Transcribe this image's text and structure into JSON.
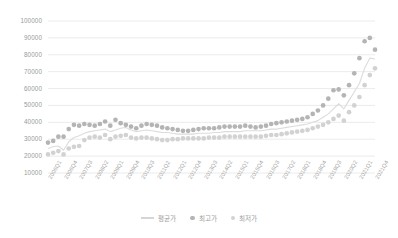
{
  "chart_data": {
    "type": "scatter",
    "title": "",
    "xlabel": "",
    "ylabel": "",
    "ylim": [
      10000,
      100000
    ],
    "ytick_values": [
      10000,
      20000,
      30000,
      40000,
      50000,
      60000,
      70000,
      80000,
      90000,
      100000
    ],
    "ytick_labels": [
      "10000",
      "20000",
      "30000",
      "40000",
      "50000",
      "60000",
      "70000",
      "80000",
      "90000",
      "100000"
    ],
    "grid": true,
    "grid_axis": "y",
    "legend_position": "bottom",
    "x": [
      "2006Q1",
      "2006Q2",
      "2006Q3",
      "2006Q4",
      "2007Q1",
      "2007Q2",
      "2007Q3",
      "2007Q4",
      "2008Q1",
      "2008Q2",
      "2008Q3",
      "2008Q4",
      "2009Q1",
      "2009Q2",
      "2009Q3",
      "2009Q4",
      "2010Q1",
      "2010Q2",
      "2010Q3",
      "2010Q4",
      "2011Q1",
      "2011Q2",
      "2011Q3",
      "2011Q4",
      "2012Q1",
      "2012Q2",
      "2012Q3",
      "2012Q4",
      "2013Q1",
      "2013Q2",
      "2013Q3",
      "2013Q4",
      "2014Q1",
      "2014Q2",
      "2014Q3",
      "2014Q4",
      "2015Q1",
      "2015Q2",
      "2015Q3",
      "2015Q4",
      "2016Q1",
      "2016Q2",
      "2016Q3",
      "2016Q4",
      "2017Q1",
      "2017Q2",
      "2017Q3",
      "2017Q4",
      "2018Q1",
      "2018Q2",
      "2018Q3",
      "2018Q4",
      "2019Q1",
      "2019Q2",
      "2019Q3",
      "2019Q4",
      "2020Q1",
      "2020Q2",
      "2020Q3",
      "2020Q4",
      "2021Q1",
      "2021Q2",
      "2021Q3",
      "2021Q4"
    ],
    "xtick_labels": [
      "2006Q1",
      "2006Q4",
      "2007Q3",
      "2008Q2",
      "2009Q1",
      "2009Q4",
      "2010Q3",
      "2011Q2",
      "2012Q1",
      "2012Q4",
      "2013Q3",
      "2014Q2",
      "2015Q1",
      "2015Q4",
      "2016Q3",
      "2017Q2",
      "2018Q1",
      "2018Q4",
      "2019Q3",
      "2020Q2",
      "2021Q1",
      "2021Q4"
    ],
    "xtick_step": 3,
    "series": [
      {
        "name": "평균가",
        "kind": "line",
        "color": "#dcdcdc",
        "values": [
          24500,
          25500,
          26000,
          23500,
          28500,
          31000,
          32000,
          33500,
          34500,
          35000,
          35500,
          36000,
          34500,
          35500,
          36500,
          37000,
          35500,
          34500,
          35000,
          35500,
          35000,
          34500,
          34000,
          34000,
          33500,
          33000,
          33000,
          33000,
          33000,
          33500,
          33500,
          33500,
          34000,
          34000,
          34500,
          34500,
          34500,
          34500,
          35000,
          35000,
          35000,
          35000,
          35500,
          36000,
          36000,
          36500,
          37000,
          37500,
          38000,
          38500,
          39000,
          40000,
          41000,
          43000,
          45000,
          48000,
          51000,
          48000,
          53000,
          58000,
          63000,
          72000,
          78000,
          77500
        ]
      },
      {
        "name": "최고가",
        "kind": "scatter",
        "color": "#b4b4b4",
        "values": [
          28000,
          29000,
          31500,
          31500,
          36000,
          38500,
          38000,
          39000,
          38500,
          38000,
          39000,
          40500,
          38000,
          41500,
          39500,
          38500,
          37500,
          36500,
          38000,
          39000,
          38500,
          38000,
          37000,
          36500,
          36000,
          35500,
          35000,
          35000,
          35500,
          36000,
          36500,
          36500,
          36500,
          37000,
          37500,
          37500,
          37500,
          37500,
          38000,
          37500,
          37000,
          37500,
          38000,
          39000,
          39500,
          40000,
          40500,
          41000,
          41500,
          42000,
          43000,
          45000,
          47000,
          50000,
          54000,
          59000,
          59500,
          56000,
          62000,
          69000,
          78000,
          88000,
          90000,
          83000
        ]
      },
      {
        "name": "최저가",
        "kind": "scatter",
        "color": "#d2d2d2",
        "values": [
          21000,
          22000,
          23000,
          21000,
          24500,
          25500,
          26000,
          29500,
          31000,
          31500,
          31000,
          32500,
          30000,
          31500,
          32000,
          32500,
          31000,
          30500,
          31000,
          31000,
          30500,
          30000,
          29500,
          29500,
          30000,
          30000,
          30500,
          30500,
          30500,
          30500,
          30500,
          31000,
          31000,
          31000,
          31500,
          31500,
          31500,
          31500,
          31500,
          31500,
          31500,
          31500,
          32000,
          32500,
          32500,
          33000,
          33500,
          34000,
          34500,
          35000,
          35500,
          36500,
          37500,
          38500,
          40000,
          42000,
          44000,
          41000,
          46000,
          50000,
          55000,
          62000,
          68000,
          72000
        ]
      }
    ]
  }
}
